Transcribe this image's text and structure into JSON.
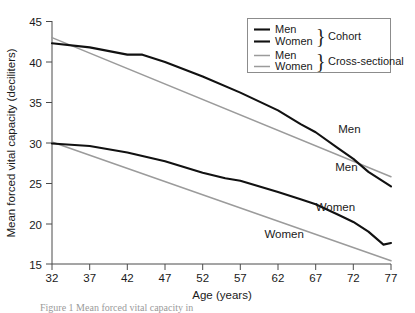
{
  "chart_data": {
    "type": "line",
    "title": "",
    "xlabel": "Age (years)",
    "ylabel": "Mean forced vital capacity (deciliters)",
    "xlim": [
      32,
      77
    ],
    "ylim": [
      15,
      45
    ],
    "xticks": [
      32,
      37,
      42,
      47,
      52,
      57,
      62,
      67,
      72,
      77
    ],
    "yticks": [
      15,
      20,
      25,
      30,
      35,
      40,
      45
    ],
    "grid": false,
    "legend_position": "top-right",
    "series": [
      {
        "name": "Men",
        "group": "Cohort",
        "color": "#111111",
        "x": [
          32,
          37,
          42,
          44,
          47,
          52,
          57,
          62,
          65,
          67,
          70,
          72,
          74,
          77
        ],
        "values": [
          42.3,
          41.8,
          40.9,
          40.9,
          40.0,
          38.2,
          36.2,
          34.0,
          32.3,
          31.3,
          29.3,
          28.0,
          26.4,
          24.6
        ]
      },
      {
        "name": "Women",
        "group": "Cohort",
        "color": "#111111",
        "x": [
          32,
          37,
          42,
          47,
          52,
          55,
          57,
          62,
          65,
          67,
          70,
          72,
          74,
          76,
          77
        ],
        "values": [
          29.9,
          29.6,
          28.8,
          27.7,
          26.3,
          25.6,
          25.3,
          23.9,
          23.0,
          22.4,
          21.1,
          20.2,
          19.0,
          17.4,
          17.6
        ]
      },
      {
        "name": "Men",
        "group": "Cross-sectional",
        "color": "#9b9b9b",
        "x": [
          32,
          77
        ],
        "values": [
          43.0,
          25.8
        ]
      },
      {
        "name": "Women",
        "group": "Cross-sectional",
        "color": "#9b9b9b",
        "x": [
          32,
          77
        ],
        "values": [
          30.1,
          15.4
        ]
      }
    ],
    "annotations": [
      {
        "text": "Men",
        "x": 70.0,
        "y": 31.2,
        "series": "Cross-sectional Men"
      },
      {
        "text": "Men",
        "x": 69.6,
        "y": 26.5,
        "series": "Cohort Men"
      },
      {
        "text": "Women",
        "x": 67.0,
        "y": 21.5,
        "series": "Cohort Women"
      },
      {
        "text": "Women",
        "x": 60.2,
        "y": 18.2,
        "series": "Cross-sectional Women"
      }
    ]
  },
  "legend": {
    "entries": [
      {
        "label": "Men",
        "style": "cohort"
      },
      {
        "label": "Women",
        "style": "cohort"
      },
      {
        "label": "Men",
        "style": "cross"
      },
      {
        "label": "Women",
        "style": "cross"
      }
    ],
    "group_labels": [
      {
        "text": "Cohort"
      },
      {
        "text": "Cross-sectional"
      }
    ],
    "brace": "}"
  },
  "axes": {
    "x_title": "Age (years)",
    "y_title": "Mean forced vital capacity (deciliters)",
    "x_tick_labels": [
      "32",
      "37",
      "42",
      "47",
      "52",
      "57",
      "62",
      "67",
      "72",
      "77"
    ],
    "y_tick_labels": [
      "45",
      "40",
      "35",
      "30",
      "25",
      "20",
      "15"
    ]
  },
  "caption": {
    "line1": "Figure 1 Mean forced vital capacity in"
  }
}
